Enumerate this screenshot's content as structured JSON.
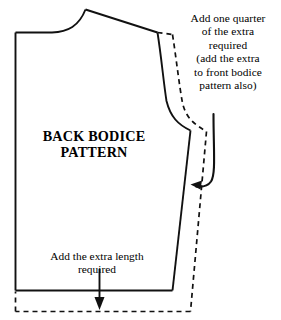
{
  "diagram": {
    "kind": "sewing-pattern-alteration-diagram",
    "title_label": "BACK BODICE\nPATTERN",
    "colors": {
      "ink": "#111111",
      "background": "#ffffff"
    },
    "annotations": {
      "shoulder_note": "Add one quarter\nof the extra\nrequired\n(add the extra\nto front bodice\npattern also)",
      "length_note": "Add the extra length\nrequired"
    },
    "lines": {
      "original_outline_style": "solid",
      "enlarged_outline_style": "dashed"
    },
    "arrows": [
      {
        "name": "curved-arrow-to-side-seam",
        "direction": "down-left",
        "points_to": "dashed side seam"
      },
      {
        "name": "straight-arrow-to-hem",
        "direction": "down",
        "points_to": "dashed hem line"
      }
    ]
  }
}
